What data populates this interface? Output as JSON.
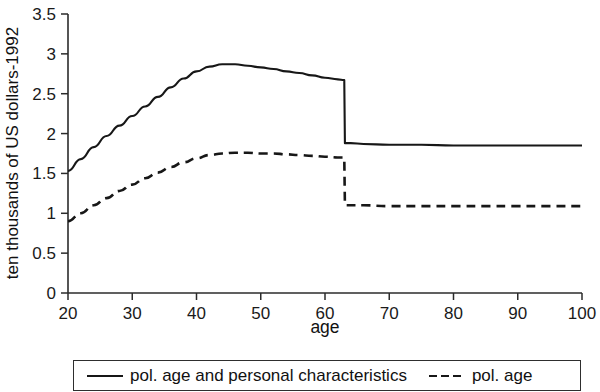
{
  "chart_data": {
    "type": "line",
    "title": "",
    "xlabel": "age",
    "ylabel": "ten thousands of US dollars-1992",
    "xlim": [
      20,
      100
    ],
    "ylim": [
      0,
      3.5
    ],
    "xticks": [
      20,
      30,
      40,
      50,
      60,
      70,
      80,
      90,
      100
    ],
    "xtick_labels": [
      "20",
      "30",
      "40",
      "50",
      "60",
      "70",
      "80",
      "90",
      "100"
    ],
    "yticks": [
      0,
      0.5,
      1,
      1.5,
      2,
      2.5,
      3,
      3.5
    ],
    "ytick_labels": [
      "0",
      "0.5",
      "1",
      "1.5",
      "2",
      "2.5",
      "3",
      "3.5"
    ],
    "grid": false,
    "legend_position": "below-axes",
    "series": [
      {
        "name": "pol. age and personal characteristics",
        "style": "solid",
        "color": "#171717",
        "x": [
          20,
          22,
          24,
          26,
          28,
          30,
          32,
          34,
          36,
          38,
          40,
          42,
          44,
          46,
          48,
          50,
          52,
          54,
          56,
          58,
          60,
          62,
          63,
          63.1,
          64,
          66,
          70,
          75,
          80,
          85,
          90,
          95,
          100
        ],
        "values": [
          1.53,
          1.68,
          1.83,
          1.97,
          2.1,
          2.22,
          2.34,
          2.46,
          2.58,
          2.69,
          2.78,
          2.84,
          2.87,
          2.87,
          2.85,
          2.83,
          2.81,
          2.78,
          2.76,
          2.73,
          2.7,
          2.68,
          2.67,
          1.88,
          1.88,
          1.87,
          1.86,
          1.86,
          1.85,
          1.85,
          1.85,
          1.85,
          1.85
        ]
      },
      {
        "name": "pol. age",
        "style": "dashed",
        "color": "#171717",
        "x": [
          20,
          22,
          24,
          26,
          28,
          30,
          32,
          34,
          36,
          38,
          40,
          42,
          44,
          46,
          48,
          50,
          52,
          54,
          56,
          58,
          60,
          62,
          63,
          63.1,
          64,
          66,
          70,
          75,
          80,
          85,
          90,
          95,
          100
        ],
        "values": [
          0.9,
          1.0,
          1.1,
          1.19,
          1.28,
          1.36,
          1.44,
          1.51,
          1.58,
          1.64,
          1.69,
          1.73,
          1.75,
          1.76,
          1.76,
          1.75,
          1.75,
          1.74,
          1.73,
          1.72,
          1.71,
          1.7,
          1.7,
          1.1,
          1.1,
          1.1,
          1.09,
          1.09,
          1.09,
          1.09,
          1.09,
          1.09,
          1.09
        ]
      }
    ]
  },
  "legend": {
    "entries": [
      {
        "label": "pol. age and personal characteristics",
        "style": "solid"
      },
      {
        "label": "pol. age",
        "style": "dashed"
      }
    ]
  }
}
